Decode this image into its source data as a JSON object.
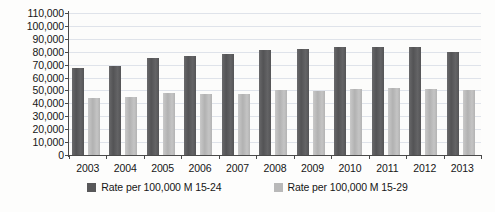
{
  "chart_data": {
    "type": "bar",
    "title": "",
    "subtitle": "",
    "xlabel": "",
    "ylabel": "",
    "categories": [
      "2003",
      "2004",
      "2005",
      "2006",
      "2007",
      "2008",
      "2009",
      "2010",
      "2011",
      "2012",
      "2013"
    ],
    "series": [
      {
        "name": "Rate per 100,000 M 15-24",
        "color": "#58585a",
        "values": [
          67500,
          69000,
          75000,
          77000,
          78500,
          81500,
          82500,
          84000,
          84000,
          83500,
          80000
        ]
      },
      {
        "name": "Rate per 100,000 M 15-29",
        "color": "#b9b9b9",
        "values": [
          44500,
          45000,
          48000,
          47000,
          47500,
          50500,
          49500,
          51000,
          52000,
          51500,
          50000
        ]
      }
    ],
    "ylim": [
      0,
      110000
    ],
    "ytick_step": 10000,
    "ytick_labels": [
      "110,000",
      "100,000",
      "90,000",
      "80,000",
      "70,000",
      "60,000",
      "50,000",
      "40,000",
      "30,000",
      "20,000",
      "10,000",
      "0"
    ],
    "grid": true,
    "legend_position": "bottom"
  },
  "legend": {
    "items": [
      {
        "label": "Rate per 100,000 M 15-24",
        "swatch": "series-a"
      },
      {
        "label": "Rate per 100,000 M 15-29",
        "swatch": "series-b"
      }
    ]
  },
  "caption": {
    "remnant": ""
  }
}
